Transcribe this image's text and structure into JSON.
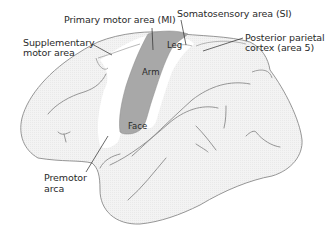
{
  "diagram": {
    "colors": {
      "outline": "#8a8a8a",
      "cortex_fill": "#f1f1f1",
      "primary_motor_fill": "#a8a8a8",
      "highlight_band": "#ffffff",
      "text": "#2a2a2a"
    },
    "labels": {
      "primary_motor": "Primary motor area (MI)",
      "somatosensory": "Somatosensory area (SI)",
      "supplementary_line1": "Supplementary",
      "supplementary_line2": "motor area",
      "posterior_parietal_line1": "Posterior parietal",
      "posterior_parietal_line2": "cortex (area 5)",
      "premotor_line1": "Premotor",
      "premotor_line2": "arca"
    },
    "somatotopy": {
      "leg": "Leg",
      "arm": "Arm",
      "face": "Face"
    }
  }
}
